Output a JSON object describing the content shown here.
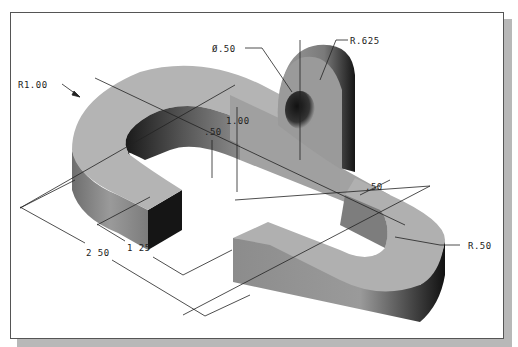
{
  "figure": {
    "type": "isometric technical drawing",
    "colors": {
      "frame_border": "#555555",
      "shadow": "#b8b8b8",
      "top_face": "#b4b4b4",
      "side_face": "#8a8a8a",
      "dark_face": "#1c1c1c",
      "dimension_line": "#222222"
    }
  },
  "dimensions": {
    "hole_diameter": "Ø.50",
    "boss_radius": "R.625",
    "outer_radius": "R1.00",
    "inner_height": ".50",
    "total_height": "1.00",
    "slot_width": ".50",
    "inner_radius": "R.50",
    "length_inner": "1 25",
    "length_outer": "2 50"
  }
}
